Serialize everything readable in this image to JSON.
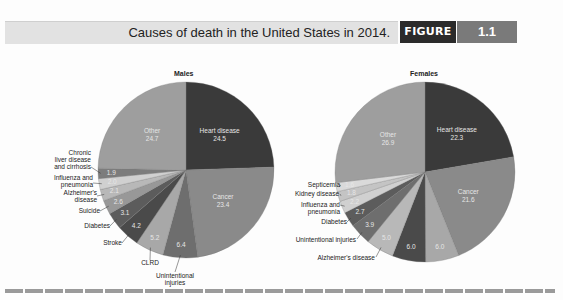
{
  "header": {
    "title": "Causes of death in the United States in 2014.",
    "figure_label": "FIGURE",
    "figure_number": "1.1"
  },
  "chart_data": [
    {
      "type": "pie",
      "title": "Males",
      "unit": "percent",
      "slices": [
        {
          "label": "Heart disease",
          "value": 24.5,
          "color": "#3a3a3a"
        },
        {
          "label": "Cancer",
          "value": 23.4,
          "color": "#8a8a8a"
        },
        {
          "label": "Unintentional injuries",
          "value": 6.4,
          "color": "#6e6e6e"
        },
        {
          "label": "CLRD",
          "value": 5.2,
          "color": "#a8a8a8"
        },
        {
          "label": "Stroke",
          "value": 4.2,
          "color": "#4a4a4a"
        },
        {
          "label": "Diabetes",
          "value": 3.1,
          "color": "#5c5c5c"
        },
        {
          "label": "Suicide",
          "value": 2.6,
          "color": "#989898"
        },
        {
          "label": "Alzheimer's disease",
          "value": 2.1,
          "color": "#b8b8b8"
        },
        {
          "label": "Influenza and pneumonia",
          "value": 2.0,
          "color": "#d0d0d0"
        },
        {
          "label": "Chronic liver disease and cirrhosis",
          "value": 1.9,
          "color": "#7c7c7c"
        },
        {
          "label": "Other",
          "value": 24.7,
          "color": "#9e9e9e"
        }
      ]
    },
    {
      "type": "pie",
      "title": "Females",
      "unit": "percent",
      "slices": [
        {
          "label": "Heart disease",
          "value": 22.3,
          "color": "#3a3a3a"
        },
        {
          "label": "Cancer",
          "value": 21.6,
          "color": "#8a8a8a"
        },
        {
          "label": "CLRD",
          "value": 6.0,
          "color": "#a8a8a8"
        },
        {
          "label": "Stroke",
          "value": 6.0,
          "color": "#4a4a4a"
        },
        {
          "label": "Alzheimer's disease",
          "value": 5.0,
          "color": "#b8b8b8"
        },
        {
          "label": "Unintentional injuries",
          "value": 3.9,
          "color": "#6e6e6e"
        },
        {
          "label": "Diabetes",
          "value": 2.7,
          "color": "#5c5c5c"
        },
        {
          "label": "Influenza and pneumonia",
          "value": 2.2,
          "color": "#d0d0d0"
        },
        {
          "label": "Kidney disease",
          "value": 1.8,
          "color": "#c4c4c4"
        },
        {
          "label": "Septicemia",
          "value": 1.6,
          "color": "#dadada"
        },
        {
          "label": "Other",
          "value": 26.9,
          "color": "#9e9e9e"
        }
      ]
    }
  ]
}
